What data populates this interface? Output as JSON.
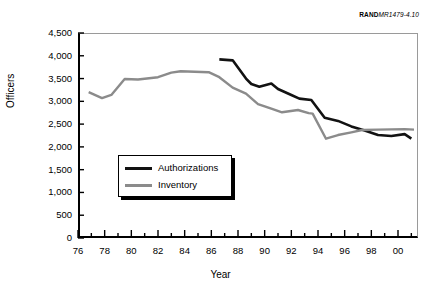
{
  "source_id": {
    "prefix": "RAND",
    "suffix": "MR1479-4.10"
  },
  "chart_data": {
    "type": "line",
    "title": "",
    "xlabel": "Year",
    "ylabel": "Officers",
    "xlim": [
      1976,
      2001.5
    ],
    "ylim": [
      0,
      4500
    ],
    "ytick_values": [
      0,
      500,
      1000,
      1500,
      2000,
      2500,
      3000,
      3500,
      4000,
      4500
    ],
    "ytick_labels": [
      "0",
      "500",
      "1,000",
      "1,500",
      "2,000",
      "2,500",
      "3,000",
      "3,500",
      "4,000",
      "4,500"
    ],
    "xtick_values": [
      1976,
      1978,
      1980,
      1982,
      1984,
      1986,
      1988,
      1990,
      1992,
      1994,
      1996,
      1998,
      2000
    ],
    "xtick_labels": [
      "76",
      "78",
      "80",
      "82",
      "84",
      "86",
      "88",
      "90",
      "92",
      "94",
      "96",
      "98",
      "00"
    ],
    "minor_xticks": true,
    "grid": false,
    "legend_position": "lower-left-inside",
    "series": [
      {
        "name": "Authorizations",
        "color": "#121212",
        "x": [
          1986.6,
          1987.6,
          1988.6,
          1989.0,
          1989.6,
          1990.5,
          1991.0,
          1992.0,
          1992.6,
          1993.5,
          1994.5,
          1995.5,
          1996.5,
          1997.5,
          1998.5,
          1999.5,
          2000.5,
          2001.0
        ],
        "y": [
          3920,
          3900,
          3500,
          3380,
          3320,
          3390,
          3270,
          3140,
          3060,
          3030,
          2640,
          2570,
          2450,
          2360,
          2260,
          2240,
          2280,
          2180
        ]
      },
      {
        "name": "Inventory",
        "color": "#8b8b8b",
        "x": [
          1976.8,
          1977.8,
          1978.5,
          1979.5,
          1980.5,
          1982.0,
          1983.0,
          1983.7,
          1985.8,
          1986.6,
          1987.6,
          1988.6,
          1989.5,
          1990.5,
          1991.3,
          1992.5,
          1993.3,
          1993.6,
          1994.6,
          1995.5,
          1996.5,
          1997.3,
          1998.5,
          2000.5,
          2001.2
        ],
        "y": [
          3200,
          3070,
          3140,
          3490,
          3480,
          3530,
          3630,
          3660,
          3640,
          3530,
          3300,
          3170,
          2940,
          2840,
          2760,
          2810,
          2740,
          2730,
          2180,
          2260,
          2320,
          2370,
          2380,
          2390,
          2380
        ]
      }
    ]
  }
}
